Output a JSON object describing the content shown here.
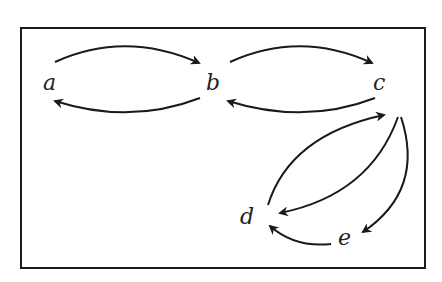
{
  "diagram": {
    "type": "directed-graph",
    "nodes": [
      {
        "id": "a",
        "label": "a",
        "x": 50,
        "y": 89
      },
      {
        "id": "b",
        "label": "b",
        "x": 213,
        "y": 89
      },
      {
        "id": "c",
        "label": "c",
        "x": 380,
        "y": 89
      },
      {
        "id": "d",
        "label": "d",
        "x": 246,
        "y": 224
      },
      {
        "id": "e",
        "label": "e",
        "x": 345,
        "y": 245
      }
    ],
    "edges": [
      {
        "from": "a",
        "to": "b"
      },
      {
        "from": "b",
        "to": "a"
      },
      {
        "from": "b",
        "to": "c"
      },
      {
        "from": "c",
        "to": "b"
      },
      {
        "from": "d",
        "to": "c"
      },
      {
        "from": "c",
        "to": "d"
      },
      {
        "from": "c",
        "to": "e"
      },
      {
        "from": "e",
        "to": "d"
      }
    ],
    "colors": {
      "stroke": "#1a1a1a",
      "background": "#ffffff"
    }
  }
}
